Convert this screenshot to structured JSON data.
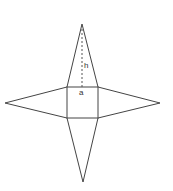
{
  "diagram": {
    "labels": {
      "height": "h",
      "base_side": "a"
    },
    "colors": {
      "line": "#444444",
      "background": "#ffffff"
    }
  }
}
